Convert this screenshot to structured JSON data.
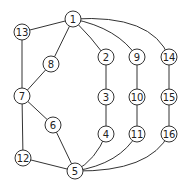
{
  "graph": {
    "nodes": [
      {
        "id": "1",
        "x": 73,
        "y": 19
      },
      {
        "id": "13",
        "x": 22,
        "y": 32
      },
      {
        "id": "8",
        "x": 51,
        "y": 64
      },
      {
        "id": "2",
        "x": 106,
        "y": 57
      },
      {
        "id": "9",
        "x": 137,
        "y": 57
      },
      {
        "id": "14",
        "x": 169,
        "y": 57
      },
      {
        "id": "7",
        "x": 22,
        "y": 96
      },
      {
        "id": "3",
        "x": 106,
        "y": 97
      },
      {
        "id": "10",
        "x": 137,
        "y": 97
      },
      {
        "id": "15",
        "x": 169,
        "y": 97
      },
      {
        "id": "6",
        "x": 53,
        "y": 125
      },
      {
        "id": "4",
        "x": 106,
        "y": 134
      },
      {
        "id": "11",
        "x": 137,
        "y": 134
      },
      {
        "id": "16",
        "x": 169,
        "y": 134
      },
      {
        "id": "12",
        "x": 23,
        "y": 158
      },
      {
        "id": "5",
        "x": 75,
        "y": 171
      }
    ],
    "edges": [
      {
        "from": "1",
        "to": "13",
        "d": "M73,19 L22,32"
      },
      {
        "from": "1",
        "to": "8",
        "d": "M73,19 L51,64"
      },
      {
        "from": "1",
        "to": "2",
        "d": "M73,19 Q92,38 106,57"
      },
      {
        "from": "1",
        "to": "9",
        "d": "M73,19 Q118,28 137,57"
      },
      {
        "from": "1",
        "to": "14",
        "d": "M73,19 Q152,14 169,57"
      },
      {
        "from": "13",
        "to": "7",
        "d": "M22,32 L22,96"
      },
      {
        "from": "8",
        "to": "7",
        "d": "M51,64 L22,96"
      },
      {
        "from": "2",
        "to": "3",
        "d": "M106,57 L106,97"
      },
      {
        "from": "9",
        "to": "10",
        "d": "M137,57 L137,97"
      },
      {
        "from": "14",
        "to": "15",
        "d": "M169,57 L169,97"
      },
      {
        "from": "7",
        "to": "6",
        "d": "M22,96 L53,125"
      },
      {
        "from": "7",
        "to": "12",
        "d": "M22,96 L23,158"
      },
      {
        "from": "3",
        "to": "4",
        "d": "M106,97 L106,134"
      },
      {
        "from": "10",
        "to": "11",
        "d": "M137,97 L137,134"
      },
      {
        "from": "15",
        "to": "16",
        "d": "M169,97 L169,134"
      },
      {
        "from": "6",
        "to": "5",
        "d": "M53,125 L75,171"
      },
      {
        "from": "12",
        "to": "5",
        "d": "M23,158 L75,171"
      },
      {
        "from": "4",
        "to": "5",
        "d": "M106,134 Q96,160 75,171"
      },
      {
        "from": "11",
        "to": "5",
        "d": "M137,134 Q120,164 75,171"
      },
      {
        "from": "16",
        "to": "5",
        "d": "M169,134 Q150,172 75,171"
      }
    ],
    "node_radius": 8
  }
}
